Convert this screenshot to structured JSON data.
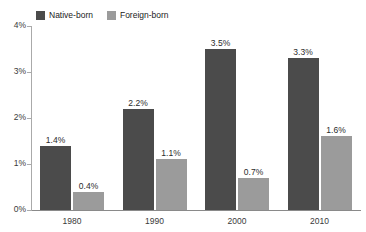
{
  "chart_data": {
    "type": "bar",
    "title": "",
    "subtitle": "",
    "xlabel": "",
    "ylabel": "",
    "categories": [
      "1980",
      "1990",
      "2000",
      "2010"
    ],
    "series": [
      {
        "name": "Native-born",
        "color": "#4b4b4b",
        "values": [
          1.4,
          2.2,
          3.5,
          3.3
        ],
        "labels": [
          "1.4%",
          "2.2%",
          "3.5%",
          "3.3%"
        ]
      },
      {
        "name": "Foreign-born",
        "color": "#9b9b9b",
        "values": [
          0.4,
          1.1,
          0.7,
          1.6
        ],
        "labels": [
          "0.4%",
          "1.1%",
          "0.7%",
          "1.6%"
        ]
      }
    ],
    "ylim": [
      0,
      4
    ],
    "yticks": [
      0,
      1,
      2,
      3,
      4
    ],
    "ytick_labels": [
      "0%",
      "1%",
      "2%",
      "3%",
      "4%"
    ],
    "grid": false,
    "legend_position": "top-left"
  },
  "legend": {
    "items": [
      {
        "label": "Native-born",
        "color": "#4b4b4b"
      },
      {
        "label": "Foreign-born",
        "color": "#9b9b9b"
      }
    ]
  },
  "axis": {
    "y_labels": [
      "4%",
      "3%",
      "2%",
      "1%",
      "0%"
    ],
    "x_labels": [
      "1980",
      "1990",
      "2000",
      "2010"
    ]
  }
}
